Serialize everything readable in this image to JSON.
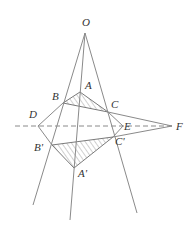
{
  "figure": {
    "type": "geometry-diagram",
    "colors": {
      "line": "#8a8a8a",
      "label": "#333333",
      "hatch": "#8a8a8a",
      "background": "#ffffff"
    },
    "points": {
      "O": {
        "label": "O",
        "x": 85,
        "y": 33
      },
      "A": {
        "label": "A",
        "x": 80,
        "y": 92
      },
      "B": {
        "label": "B",
        "x": 63,
        "y": 103
      },
      "C": {
        "label": "C",
        "x": 108,
        "y": 112
      },
      "D": {
        "label": "D",
        "x": 38,
        "y": 126
      },
      "E": {
        "label": "E",
        "x": 123,
        "y": 126
      },
      "F": {
        "label": "F",
        "x": 172,
        "y": 126
      },
      "A1": {
        "label": "A'",
        "x": 74,
        "y": 168
      },
      "B1": {
        "label": "B'",
        "x": 52,
        "y": 145
      },
      "C1": {
        "label": "C'",
        "x": 113,
        "y": 137
      }
    },
    "labels": {
      "O": "O",
      "A": "A",
      "B": "B",
      "C": "C",
      "D": "D",
      "E": "E",
      "F": "F",
      "A1": "A'",
      "B1": "B'",
      "C1": "C'"
    },
    "hatched_triangles": [
      "ABC",
      "A'B'C'"
    ],
    "dashed_line": "through D, E, F"
  }
}
